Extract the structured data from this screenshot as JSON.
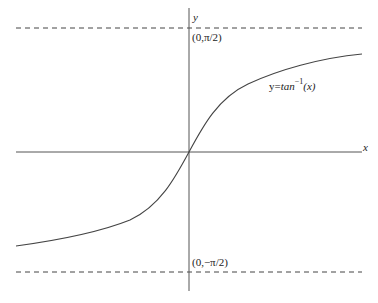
{
  "diagram": {
    "function_label": {
      "prefix": "y=",
      "fn": "tan",
      "exponent": "−1",
      "arg": "(x)"
    },
    "axes": {
      "x_label": "x",
      "y_label": "y"
    },
    "asymptotes": [
      {
        "label": "(0,π/2)",
        "value": "pi/2",
        "style": "dashed"
      },
      {
        "label": "(0,−π/2)",
        "value": "-pi/2",
        "style": "dashed"
      }
    ],
    "colors": {
      "stroke": "#444444",
      "background": "#ffffff"
    }
  }
}
